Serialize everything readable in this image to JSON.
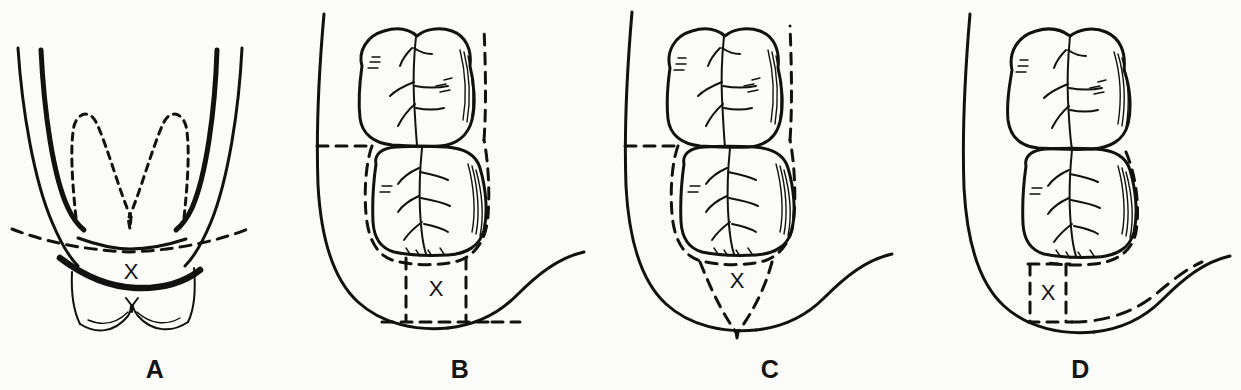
{
  "figure": {
    "background_color": "#fbfbf9",
    "ink_color": "#111111",
    "panel_count": 4,
    "marker_label": "X"
  },
  "panels": [
    {
      "id": "panel-a",
      "label": "A",
      "view": "anterior (frontal) view of mandible",
      "marker": "X",
      "description": "Frontal view of the mandible showing dashed V-shaped outlines of hidden tooth roots, a dashed horizontal bone-level line, a heavy solid curve below it, and the X marking the interposed bone segment above the lower incisors.",
      "features": [
        "outer mandible border left",
        "outer mandible border right",
        "inner ramus border left",
        "inner ramus border right",
        "dashed impacted tooth root outline (V shape)",
        "dashed bone level line",
        "heavy solid resection curve",
        "incisor crown outlines",
        "X bone marker"
      ]
    },
    {
      "id": "panel-b",
      "label": "B",
      "view": "occlusal (superior) view, right mandible",
      "marker": "X",
      "description": "Occlusal view with second and third molars; full dashed outline encircles the third molar, and a rectangular dashed box below encloses the X marking a box-shaped bone removal area extending to the inferior border.",
      "removal_shape": "rectangular box",
      "features": [
        "lingual mandible border",
        "buccal mandible border",
        "second molar occlusal surface",
        "third molar occlusal surface",
        "dashed outline around third molar",
        "dashed horizontal line to lingual border",
        "rectangular dashed bone removal box",
        "X bone marker"
      ]
    },
    {
      "id": "panel-c",
      "label": "C",
      "view": "occlusal (superior) view, right mandible",
      "marker": "X",
      "description": "Occlusal view with second and third molars; full dashed outline encircles the third molar, and a narrow inverted triangular dashed wedge below converges to a point at the inferior border, enclosing the X.",
      "removal_shape": "inverted triangular wedge",
      "features": [
        "lingual mandible border",
        "buccal mandible border",
        "second molar occlusal surface",
        "third molar occlusal surface",
        "dashed outline around third molar",
        "dashed horizontal line to lingual border",
        "triangular dashed bone removal wedge",
        "X bone marker"
      ]
    },
    {
      "id": "panel-d",
      "label": "D",
      "view": "occlusal (superior) view, right mandible",
      "marker": "X",
      "description": "Occlusal view with second and third molars; the dashed outline follows only the distal and buccal contour of the third molar. A narrow vertical dashed box encloses the X, with a long dashed line sweeping right along the inferior border.",
      "removal_shape": "narrow vertical box with lateral dashed extension",
      "features": [
        "lingual mandible border",
        "buccal mandible border",
        "second molar occlusal surface",
        "third molar occlusal surface",
        "dashed outline along distal-buccal third molar contour",
        "narrow vertical dashed bone removal box",
        "long dashed inferior border line",
        "X bone marker"
      ]
    }
  ]
}
